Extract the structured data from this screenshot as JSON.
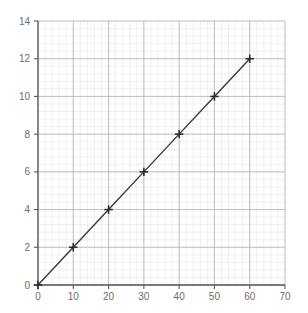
{
  "chart_data": {
    "type": "line",
    "title": "",
    "subtitle": "",
    "xlabel": "",
    "ylabel": "",
    "xlim": [
      0,
      70
    ],
    "ylim": [
      0,
      14
    ],
    "xticks": [
      0,
      10,
      20,
      30,
      40,
      50,
      60,
      70
    ],
    "yticks": [
      0,
      2,
      4,
      6,
      8,
      10,
      12,
      14
    ],
    "xtick_labels": [
      "0",
      "10",
      "20",
      "30",
      "40",
      "50",
      "60",
      "70"
    ],
    "ytick_labels": [
      "0",
      "2",
      "4",
      "6",
      "8",
      "10",
      "12",
      "14"
    ],
    "grid": true,
    "minor_grid": true,
    "minor_divisions": 5,
    "legend": null,
    "annotations": [],
    "series": [
      {
        "name": "",
        "marker": "plus",
        "x": [
          0,
          10,
          20,
          30,
          40,
          50,
          60
        ],
        "y": [
          0,
          2,
          4,
          6,
          8,
          10,
          12
        ],
        "points": [
          {
            "x": 0,
            "y": 0
          },
          {
            "x": 10,
            "y": 2
          },
          {
            "x": 20,
            "y": 4
          },
          {
            "x": 30,
            "y": 6
          },
          {
            "x": 40,
            "y": 8
          },
          {
            "x": 50,
            "y": 10
          },
          {
            "x": 60,
            "y": 12
          }
        ]
      }
    ]
  },
  "style": {
    "background": "#ffffff",
    "axis_color": "#58595b",
    "line_color": "#3a3a3a",
    "marker_color": "#2b2b2b",
    "major_grid_color": "#b9bcc0",
    "minor_grid_color": "#e4e6ea",
    "tick_label_color": "#6e6e6e"
  },
  "geometry": {
    "plot_left": 38,
    "plot_right": 285,
    "plot_top": 21,
    "plot_bottom": 285
  }
}
